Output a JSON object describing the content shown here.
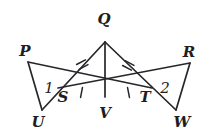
{
  "figure": {
    "width": 208,
    "height": 135,
    "background_color": "#ffffff",
    "stroke_color": "#26262b",
    "label_color": "#1d1d22"
  },
  "points": {
    "P": {
      "label": "P",
      "x": 28,
      "y": 62,
      "label_x": 25,
      "label_y": 51
    },
    "Q": {
      "label": "Q",
      "x": 105,
      "y": 42,
      "label_x": 104,
      "label_y": 19
    },
    "R": {
      "label": "R",
      "x": 190,
      "y": 63,
      "label_x": 189,
      "label_y": 52
    },
    "S": {
      "label": "S",
      "x": 58,
      "y": 88,
      "label_x": 63,
      "label_y": 97
    },
    "T": {
      "label": "T",
      "x": 152,
      "y": 88,
      "label_x": 145,
      "label_y": 97
    },
    "U": {
      "label": "U",
      "x": 42,
      "y": 110,
      "label_x": 38,
      "label_y": 122
    },
    "V": {
      "label": "V",
      "x": 105,
      "y": 97,
      "label_x": 105,
      "label_y": 113
    },
    "W": {
      "label": "W",
      "x": 176,
      "y": 110,
      "label_x": 182,
      "label_y": 122
    }
  },
  "angles": [
    {
      "label": "1",
      "x": 49,
      "y": 88,
      "vertex": "S"
    },
    {
      "label": "2",
      "x": 165,
      "y": 88,
      "vertex": "T"
    }
  ],
  "segments": [
    {
      "name": "Q-to-U",
      "from": "Q",
      "to": "U",
      "passes_through": "S"
    },
    {
      "name": "Q-to-W",
      "from": "Q",
      "to": "W",
      "passes_through": "T"
    },
    {
      "name": "Q-to-V",
      "from": "Q",
      "to": "V"
    },
    {
      "name": "P-to-T",
      "from": "P",
      "to": "T"
    },
    {
      "name": "P-to-U",
      "from": "P",
      "to": "U"
    },
    {
      "name": "R-to-S",
      "from": "R",
      "to": "S"
    },
    {
      "name": "R-to-W",
      "from": "R",
      "to": "W"
    },
    {
      "name": "S-to-V",
      "from": "S",
      "to": "V"
    },
    {
      "name": "V-to-T",
      "from": "V",
      "to": "T"
    }
  ],
  "congruence_marks": [
    {
      "name": "tick-QS",
      "segment": "Q-to-S",
      "count": 2,
      "x": 82.5,
      "y": 65,
      "angle_deg": 62
    },
    {
      "name": "tick-QT",
      "segment": "Q-to-T",
      "count": 2,
      "x": 128.5,
      "y": 65,
      "angle_deg": -62
    },
    {
      "name": "tick-SV",
      "segment": "S-to-V",
      "count": 1,
      "x": 81.5,
      "y": 92.5,
      "angle_deg": 11
    },
    {
      "name": "tick-VT",
      "segment": "V-to-T",
      "count": 1,
      "x": 128.5,
      "y": 92.5,
      "angle_deg": -11
    }
  ]
}
